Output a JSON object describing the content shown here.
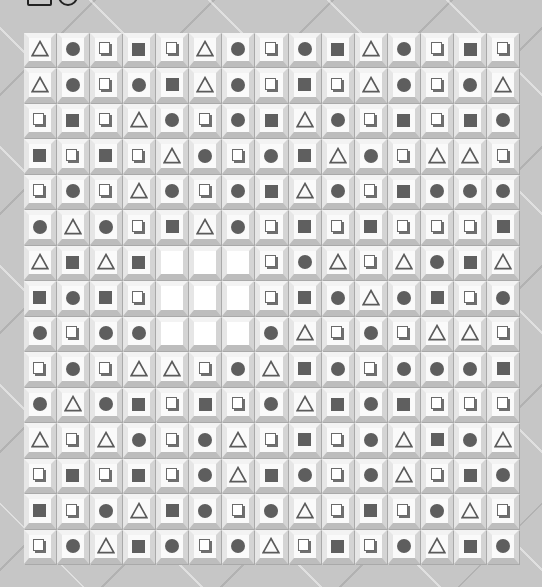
{
  "toolbar": {
    "icons": [
      {
        "name": "rectangle-icon"
      },
      {
        "name": "circle-icon"
      }
    ]
  },
  "legend": {
    "T": "triangle-outline",
    "C": "filled-circle",
    "S": "filled-square",
    "O": "outlined-square-with-shadow",
    "_": "empty"
  },
  "colors": {
    "background": "#c6c6c6",
    "tile": "#fafafa",
    "symbol": "#5e5e5e"
  },
  "board": {
    "columns": 15,
    "rows": [
      "TCOSOTCOCSTCOSO",
      "TCOCSTCOSOTCOCT",
      "OSOTCOCSTCOSOSC",
      "SOSOTCOCSTCOTTO",
      "OCOTCOCSTCOSCCC",
      "CTCOSTCOSOSOOOS",
      "TSTS___OCTOTCST",
      "SCSO___OSCTCSOC",
      "COCC___CTOCOTTO",
      "OCOTTOCTSCOCCCS",
      "CTCSOSOCTSCSOOO",
      "TOTCOCTOSOCTSCT",
      "OSOSOCTSCOCTOSC",
      "SOCTSCOCTOSOCTO",
      "OCTSCOCTOSOCTSC"
    ]
  }
}
